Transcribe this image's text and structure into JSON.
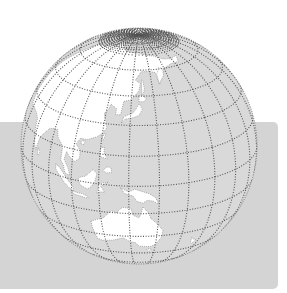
{
  "figure": {
    "title": "Globe centered on Asia-Pacific",
    "projection": "orthographic",
    "center": {
      "lon": 140,
      "lat": 20
    },
    "colors": {
      "panel": "#d4d4d4",
      "ocean": "#d9d9d9",
      "land": "#ffffff",
      "graticule": "#555555",
      "outline": "#777777",
      "background": "#ffffff"
    },
    "regions_visible": [
      "Asia",
      "Japan",
      "Philippines",
      "Indonesia",
      "New Guinea",
      "Australia",
      "Pacific Ocean",
      "Arctic"
    ]
  }
}
